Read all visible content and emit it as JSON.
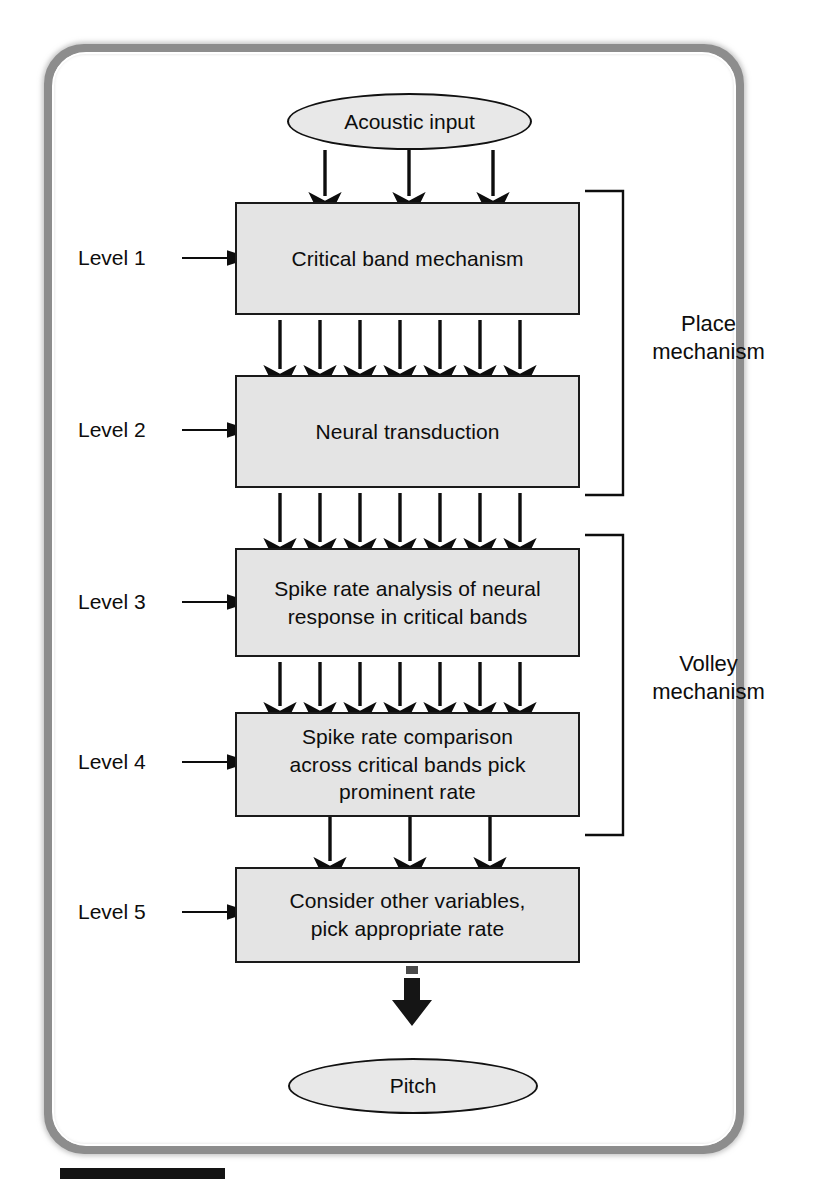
{
  "diagram": {
    "nodes": {
      "input": {
        "label": "Acoustic input",
        "shape": "ellipse"
      },
      "output": {
        "label": "Pitch",
        "shape": "ellipse"
      },
      "level1": {
        "label": "Critical band mechanism"
      },
      "level2": {
        "label": "Neural transduction"
      },
      "level3": {
        "label": "Spike rate analysis of neural\nresponse in critical bands"
      },
      "level4": {
        "label": "Spike rate comparison\nacross critical bands pick\nprominent rate"
      },
      "level5": {
        "label": "Consider other variables,\npick appropriate rate"
      }
    },
    "level_labels": [
      {
        "text": "Level 1"
      },
      {
        "text": "Level 2"
      },
      {
        "text": "Level 3"
      },
      {
        "text": "Level 4"
      },
      {
        "text": "Level 5"
      }
    ],
    "brackets": [
      {
        "text": "Place\nmechanism",
        "spans": [
          "level1",
          "level2"
        ]
      },
      {
        "text": "Volley\nmechanism",
        "spans": [
          "level3",
          "level4"
        ]
      }
    ],
    "edges": [
      {
        "from": "input",
        "to": "level1",
        "arrows": 3
      },
      {
        "from": "level1",
        "to": "level2",
        "arrows": 7
      },
      {
        "from": "level2",
        "to": "level3",
        "arrows": 7
      },
      {
        "from": "level3",
        "to": "level4",
        "arrows": 7
      },
      {
        "from": "level4",
        "to": "level5",
        "arrows": 3
      },
      {
        "from": "level5",
        "to": "output",
        "arrows": 1,
        "style": "thick"
      }
    ],
    "colors": {
      "box_fill": "#e4e4e4",
      "box_border": "#1a1a1a",
      "box_shadow": "#2b2b2b",
      "frame_border": "#8d8d8d",
      "page_background": "#ffffff",
      "text": "#0d0d0d"
    }
  }
}
